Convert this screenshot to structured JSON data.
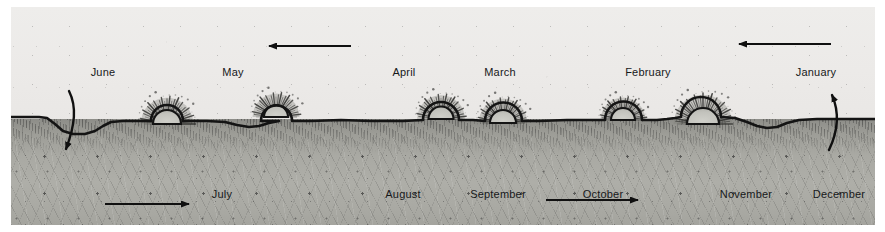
{
  "figure": {
    "colors": {
      "sky": "#eceae8",
      "ground": "#aaaaa4",
      "ink": "#17181a",
      "horizon": "#1a1a1a"
    }
  },
  "sky_labels": [
    {
      "id": "june",
      "text": "June",
      "x": 92,
      "y": 59
    },
    {
      "id": "may",
      "text": "May",
      "x": 222,
      "y": 59
    },
    {
      "id": "april",
      "text": "April",
      "x": 393,
      "y": 59
    },
    {
      "id": "march",
      "text": "March",
      "x": 489,
      "y": 59
    },
    {
      "id": "february",
      "text": "February",
      "x": 637,
      "y": 59
    },
    {
      "id": "january",
      "text": "January",
      "x": 805,
      "y": 59
    }
  ],
  "ground_labels": [
    {
      "id": "july",
      "text": "July",
      "x": 211,
      "y": 181
    },
    {
      "id": "august",
      "text": "August",
      "x": 392,
      "y": 181
    },
    {
      "id": "september",
      "text": "September",
      "x": 487,
      "y": 181
    },
    {
      "id": "october",
      "text": "October",
      "x": 592,
      "y": 181
    },
    {
      "id": "november",
      "text": "November",
      "x": 735,
      "y": 181
    },
    {
      "id": "december",
      "text": "December",
      "x": 828,
      "y": 181
    }
  ],
  "suns": [
    {
      "id": "sun-1",
      "cx": 156,
      "cy": 117,
      "r": 14,
      "rays": 30,
      "ray_len": 13
    },
    {
      "id": "sun-2",
      "cx": 265,
      "cy": 110,
      "r": 12,
      "rays": 28,
      "ray_len": 12
    },
    {
      "id": "sun-3",
      "cx": 430,
      "cy": 112,
      "r": 12.5,
      "rays": 28,
      "ray_len": 12
    },
    {
      "id": "sun-4",
      "cx": 492,
      "cy": 116,
      "r": 13,
      "rays": 28,
      "ray_len": 12
    },
    {
      "id": "sun-5",
      "cx": 612,
      "cy": 113,
      "r": 12,
      "rays": 28,
      "ray_len": 11
    },
    {
      "id": "sun-6",
      "cx": 692,
      "cy": 117,
      "r": 16,
      "rays": 32,
      "ray_len": 14
    }
  ],
  "arrows": [
    {
      "id": "arrow-sky-left",
      "direction": "left",
      "x1": 340,
      "y1": 39,
      "x2": 258,
      "y2": 39
    },
    {
      "id": "arrow-sky-right",
      "direction": "left",
      "x1": 820,
      "y1": 37,
      "x2": 728,
      "y2": 37
    },
    {
      "id": "arrow-ground-left",
      "direction": "right",
      "x1": 94,
      "y1": 197,
      "x2": 178,
      "y2": 197
    },
    {
      "id": "arrow-ground-right",
      "direction": "right",
      "x1": 535,
      "y1": 193,
      "x2": 627,
      "y2": 193
    },
    {
      "id": "arrow-curve-left",
      "direction": "down",
      "note": "curved hook turning down at left edge"
    },
    {
      "id": "arrow-curve-right",
      "direction": "up",
      "note": "curved hook turning up at right edge"
    }
  ]
}
